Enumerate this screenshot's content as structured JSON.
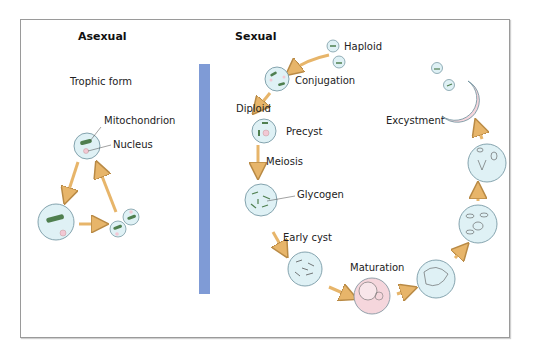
{
  "diagram": {
    "headers": {
      "asexual": "Asexual",
      "sexual": "Sexual"
    },
    "asexual_labels": {
      "trophic_form": "Trophic form",
      "mitochondrion": "Mitochondrion",
      "nucleus": "Nucleus"
    },
    "sexual_labels": {
      "haploid": "Haploid",
      "conjugation": "Conjugation",
      "diploid": "Diploid",
      "precyst": "Precyst",
      "meiosis": "Meiosis",
      "glycogen": "Glycogen",
      "early_cyst": "Early cyst",
      "maturation": "Maturation",
      "excystment": "Excystment"
    },
    "colors": {
      "cell_fill": "#dff1f5",
      "cell_stroke": "#6a8e9a",
      "cyst_pink": "#f5d6dc",
      "arrow": "#e7b56a",
      "mitochondrion": "#4f7f4f",
      "divider": "#7f9bd6"
    }
  }
}
